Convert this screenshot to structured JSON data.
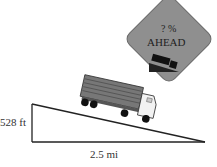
{
  "figure": {
    "sign": {
      "line1": "? %",
      "line2": "AHEAD",
      "fill_color": "#8f8f8f",
      "icon": "truck-on-downgrade-icon"
    },
    "triangle": {
      "height_label": "528 ft",
      "base_label": "2.5 mi"
    },
    "truck": {
      "icon": "semi-truck-icon"
    }
  }
}
